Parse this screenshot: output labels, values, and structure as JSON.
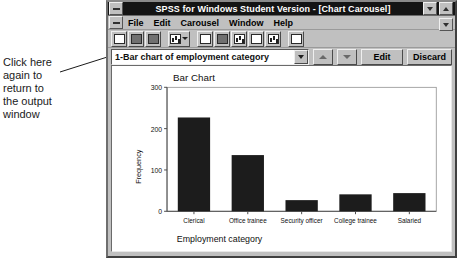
{
  "annotation": {
    "text": "Click here\nagain to\nreturn to\nthe output\nwindow",
    "pointer_label": "leader-line-to-chart-selector"
  },
  "window": {
    "title": "SPSS for Windows Student Version - [Chart Carousel]",
    "system_menu_icon": "system-menu-icon",
    "minimize_label": "minimize",
    "maximize_label": "maximize",
    "restore_label": "restore"
  },
  "menu": {
    "items": [
      {
        "label": "File",
        "accel": "F"
      },
      {
        "label": "Edit",
        "accel": "E"
      },
      {
        "label": "Carousel",
        "accel": "C"
      },
      {
        "label": "Window",
        "accel": "W"
      },
      {
        "label": "Help",
        "accel": "H"
      }
    ]
  },
  "toolbar": {
    "buttons": [
      {
        "name": "open-file-icon"
      },
      {
        "name": "save-file-icon"
      },
      {
        "name": "print-icon"
      },
      {
        "name": "chart-gallery-dropdown-icon"
      },
      {
        "name": "designate-window-icon"
      },
      {
        "name": "go-to-chart-icon"
      },
      {
        "name": "go-to-data-icon"
      },
      {
        "name": "variables-icon"
      },
      {
        "name": "run-chart-icon"
      },
      {
        "name": "info-icon"
      }
    ]
  },
  "carousel": {
    "selected_chart": "1-Bar chart of employment category",
    "dropdown_icon": "chevron-down-icon",
    "previous_icon": "triangle-up-icon",
    "next_icon": "triangle-down-icon",
    "edit_label": "Edit",
    "discard_label": "Discard"
  },
  "chart_data": {
    "type": "bar",
    "title": "Bar Chart",
    "categories": [
      "Clerical",
      "Office trainee",
      "Security officer",
      "College trainee",
      "Salaried"
    ],
    "values": [
      227,
      136,
      27,
      41,
      44
    ],
    "xlabel": "Employment category",
    "ylabel": "Frequency",
    "ylim": [
      0,
      300
    ],
    "yticks": [
      0,
      100,
      200,
      300
    ],
    "ytick_labels": [
      "0",
      "100",
      "200",
      "300"
    ],
    "grid": false,
    "legend": null,
    "bar_color": "#1c1c1c",
    "axis_color": "#4a4a4a",
    "plot_background": "#ffffff"
  }
}
